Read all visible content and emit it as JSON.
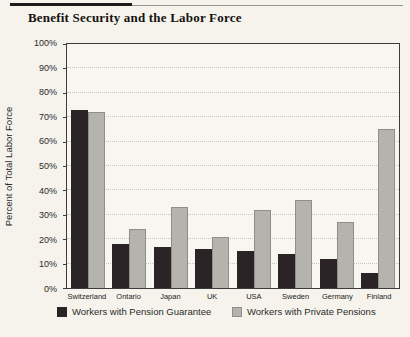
{
  "page": {
    "title": "Benefit Security and the Labor Force"
  },
  "chart_data": {
    "type": "bar",
    "title": "Benefit Security and the Labor Force",
    "xlabel": "",
    "ylabel": "Percent of Total Labor Force",
    "ylim": [
      0,
      100
    ],
    "y_tick_step": 10,
    "y_tick_labels": [
      "0%",
      "10%",
      "20%",
      "30%",
      "40%",
      "50%",
      "60%",
      "70%",
      "80%",
      "90%",
      "100%"
    ],
    "grid": "horizontal-dotted",
    "legend_position": "bottom",
    "categories": [
      "Switzerland",
      "Ontario",
      "Japan",
      "UK",
      "USA",
      "Sweden",
      "Germany",
      "Finland"
    ],
    "series": [
      {
        "name": "Workers with Pension Guarantee",
        "color": "#2a2427",
        "values": [
          73,
          18,
          17,
          16,
          15,
          14,
          12,
          6
        ]
      },
      {
        "name": "Workers with Private Pensions",
        "color": "#b4b3ae",
        "values": [
          72,
          24,
          33,
          21,
          32,
          36,
          27,
          65
        ]
      }
    ]
  },
  "colors": {
    "background": "#f5f3ec",
    "plot_background": "#f8f6f0",
    "axis": "#3c3c3c",
    "gridline": "#c7c5ba",
    "rule_thick": "#1b1b1b",
    "rule_thin": "#94948f",
    "gray_bar_border": "#8f8e88"
  }
}
